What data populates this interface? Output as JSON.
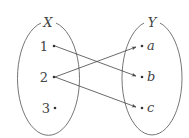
{
  "diagram": {
    "type": "mapping",
    "sets": [
      {
        "name": "X",
        "elements": [
          "1",
          "2",
          "3"
        ]
      },
      {
        "name": "Y",
        "elements": [
          "a",
          "b",
          "c"
        ]
      }
    ],
    "mappings": [
      {
        "from": "1",
        "to": "b"
      },
      {
        "from": "2",
        "to": "a"
      },
      {
        "from": "2",
        "to": "c"
      }
    ],
    "colors": {
      "stroke": "#444444",
      "background": "#ffffff"
    }
  },
  "labels": {
    "setX": "X",
    "setY": "Y",
    "x1": "1",
    "x2": "2",
    "x3": "3",
    "ya": "a",
    "yb": "b",
    "yc": "c"
  }
}
